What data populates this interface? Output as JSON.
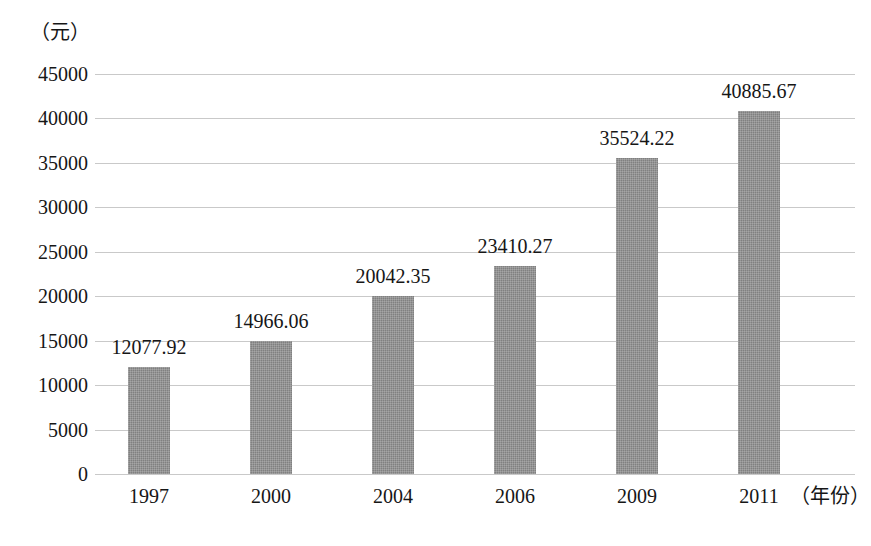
{
  "chart_data": {
    "type": "bar",
    "title": "",
    "subtitle": "",
    "xlabel": "（年份）",
    "ylabel": "（元）",
    "categories": [
      "1997",
      "2000",
      "2004",
      "2006",
      "2009",
      "2011"
    ],
    "values": [
      12077.92,
      14966.06,
      20042.35,
      23410.27,
      35524.22,
      40885.67
    ],
    "value_labels": [
      "12077.92",
      "14966.06",
      "20042.35",
      "23410.27",
      "35524.22",
      "40885.67"
    ],
    "ylim": [
      0,
      45000
    ],
    "ytick_labels": [
      "45000",
      "40000",
      "35000",
      "30000",
      "25000",
      "20000",
      "15000",
      "10000",
      "5000",
      "0"
    ],
    "ytick_values": [
      45000,
      40000,
      35000,
      30000,
      25000,
      20000,
      15000,
      10000,
      5000,
      0
    ],
    "grid": true,
    "legend": false,
    "legend_position": "none",
    "series": [
      {
        "name": "",
        "values": [
          12077.92,
          14966.06,
          20042.35,
          23410.27,
          35524.22,
          40885.67
        ]
      }
    ],
    "colors": {
      "bar_fill": "#808080",
      "gridline": "#c9c9c9",
      "text": "#161616",
      "background": "#ffffff"
    }
  }
}
